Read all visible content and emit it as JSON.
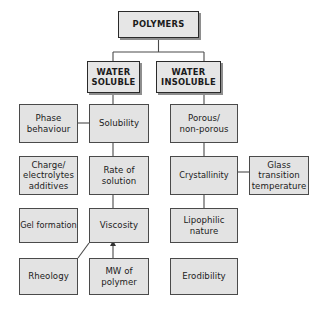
{
  "diagram": {
    "colors": {
      "node_fill": "#e3e3e3",
      "node_border": "#4a4a4a",
      "header_border": "#2a2a2a",
      "shadow": "#8e8e8e",
      "connector": "#4a4a4a",
      "text": "#1b1b1b",
      "background": "#ffffff"
    },
    "nodes": {
      "polymers": "POLYMERS",
      "water_soluble": "WATER\nSOLUBLE",
      "water_insoluble": "WATER\nINSOLUBLE",
      "phase_behaviour": "Phase\nbehaviour",
      "solubility": "Solubility",
      "porous_non_porous": "Porous/\nnon-porous",
      "charge_electrolytes_additives": "Charge/\nelectrolytes\nadditives",
      "rate_of_solution": "Rate of\nsolution",
      "crystallinity": "Crystallinity",
      "glass_transition_temperature": "Glass\ntransition\ntemperature",
      "gel_formation": "Gel formation",
      "viscosity": "Viscosity",
      "lipophilic_nature": "Lipophilic\nnature",
      "rheology": "Rheology",
      "mw_of_polymer": "MW of\npolymer",
      "erodibility": "Erodibility"
    }
  }
}
